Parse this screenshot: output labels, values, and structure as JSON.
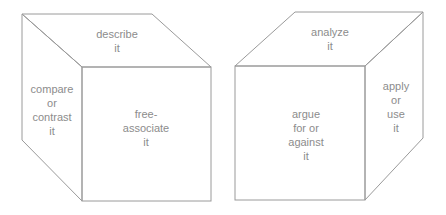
{
  "cubes": [
    {
      "name": "left-cube",
      "faces": {
        "top": [
          "describe",
          "it"
        ],
        "side": [
          "compare",
          "or",
          "contrast",
          "it"
        ],
        "front": [
          "free-",
          "associate",
          "it"
        ]
      }
    },
    {
      "name": "right-cube",
      "faces": {
        "top": [
          "analyze",
          "it"
        ],
        "front": [
          "argue",
          "for or",
          "against",
          "it"
        ],
        "side": [
          "apply",
          "or",
          "use",
          "it"
        ]
      }
    }
  ],
  "colors": {
    "line": "#9a9a9a",
    "text": "#8c8c8c",
    "background": "#ffffff"
  }
}
